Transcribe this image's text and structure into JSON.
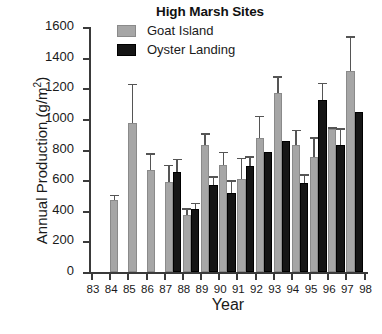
{
  "chart_data": {
    "type": "bar",
    "title": "High Marsh Sites",
    "xlabel": "Year",
    "ylabel": "Annual Production (g/m2)",
    "ylabel_base": "Annual Production (g/m",
    "ylabel_exp": "2",
    "ylabel_tail": ")",
    "ylim": [
      0,
      1600
    ],
    "yticks": [
      0,
      200,
      400,
      600,
      800,
      1000,
      1200,
      1400,
      1600
    ],
    "ytick_labels": [
      "0",
      "200",
      "400",
      "600",
      "800",
      "1000",
      "1200",
      "1400",
      "1600"
    ],
    "grid": false,
    "legend_position": "top-center",
    "categories": [
      "83",
      "84",
      "85",
      "86",
      "87",
      "88",
      "89",
      "90",
      "91",
      "92",
      "93",
      "94",
      "95",
      "96",
      "97",
      "98"
    ],
    "xtick_labels": [
      "83",
      "84",
      "85",
      "86",
      "87",
      "88",
      "89",
      "90",
      "91",
      "92",
      "93",
      "94",
      "95",
      "96",
      "97",
      "98"
    ],
    "series": [
      {
        "name": "Goat Island",
        "color": "#a6a6a6",
        "values": [
          null,
          472,
          975,
          665,
          585,
          375,
          830,
          700,
          610,
          875,
          1170,
          832,
          752,
          935,
          1315,
          null
        ],
        "errors_upper": [
          null,
          505,
          1230,
          775,
          700,
          415,
          905,
          785,
          745,
          1020,
          1280,
          930,
          880,
          945,
          1540,
          null
        ]
      },
      {
        "name": "Oyster Landing",
        "color": "#151515",
        "values": [
          null,
          null,
          null,
          null,
          655,
          412,
          565,
          518,
          695,
          782,
          855,
          580,
          1122,
          830,
          1045,
          null
        ],
        "errors_upper": [
          null,
          null,
          null,
          null,
          740,
          452,
          625,
          600,
          755,
          null,
          null,
          640,
          1235,
          940,
          null,
          null
        ]
      }
    ],
    "legend": [
      {
        "label": "Goat Island",
        "swatch": "goat"
      },
      {
        "label": "Oyster Landing",
        "swatch": "oyster"
      }
    ]
  }
}
